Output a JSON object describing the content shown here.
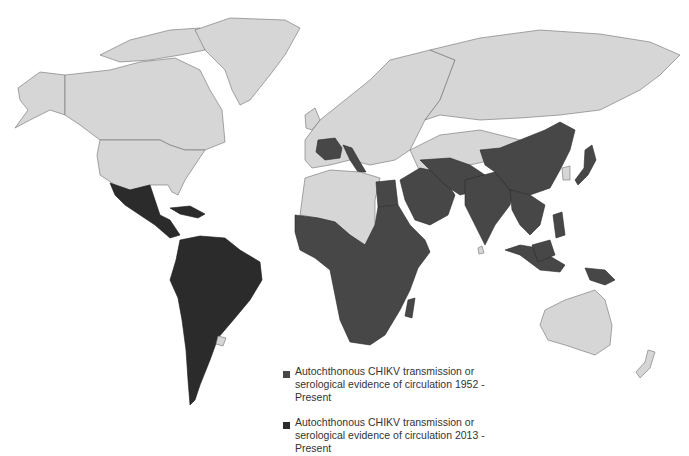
{
  "map": {
    "title": "",
    "colors": {
      "ocean": "#ffffff",
      "no_transmission": "#d6d6d6",
      "transmission_1952": "#474747",
      "transmission_2013": "#2b2b2b",
      "borders": "#6e6e6e"
    },
    "regions": {
      "transmission_1952_present": [
        "Sub-Saharan Africa",
        "Egypt",
        "Arabian Peninsula",
        "Iran",
        "Pakistan",
        "India",
        "Sri Lanka",
        "China",
        "Southeast Asia",
        "Indonesia",
        "Philippines",
        "Japan",
        "Papua New Guinea",
        "France",
        "Italy"
      ],
      "transmission_2013_present": [
        "Mexico",
        "Central America",
        "Caribbean",
        "South America"
      ],
      "no_transmission": [
        "Canada",
        "United States",
        "Greenland",
        "Russia",
        "Europe (most)",
        "North Africa (Maghreb)",
        "Central Asia",
        "Mongolia",
        "Korea",
        "Australia",
        "New Zealand",
        "Uruguay"
      ]
    }
  },
  "legend": {
    "items": [
      {
        "label": "Autochthonous CHIKV transmission or serological evidence of circulation 1952 - Present",
        "color": "#474747"
      },
      {
        "label": "Autochthonous CHIKV transmission or serological evidence of circulation 2013 - Present",
        "color": "#2b2b2b"
      }
    ]
  }
}
